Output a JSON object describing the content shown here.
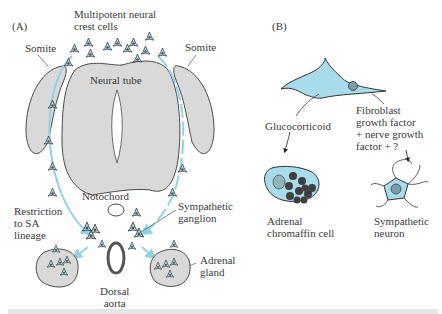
{
  "colors": {
    "tissue": "#d9d9d9",
    "cell": "#a8dcea",
    "pathway": "#8fd3e6",
    "outline": "#4a4a4a",
    "granule": "#3f3f3f"
  },
  "panelA": {
    "label": "(A)",
    "neural_crest": "Multipotent neural\ncrest cells",
    "somite_left": "Somite",
    "somite_right": "Somite",
    "neural_tube": "Neural tube",
    "notochord": "Notochord",
    "restriction": "Restriction\nto SA\nlineage",
    "sympathetic_ganglion": "Sympathetic\nganglion",
    "adrenal_gland": "Adrenal\ngland",
    "dorsal_aorta": "Dorsal\naorta"
  },
  "panelB": {
    "label": "(B)",
    "glucocorticoid": "Glucocorticoid",
    "growth_factors": "Fibroblast\ngrowth factor\n+ nerve growth\nfactor + ?",
    "chromaffin": "Adrenal\nchromaffin cell",
    "neuron": "Sympathetic\nneuron"
  }
}
